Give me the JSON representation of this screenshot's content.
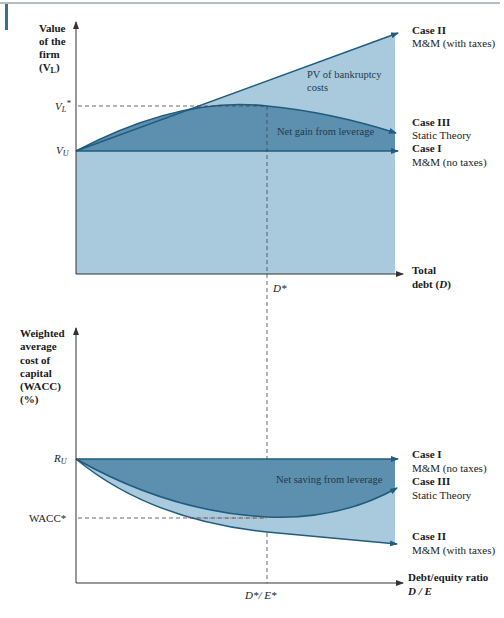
{
  "colors": {
    "light_fill": "#a9c9dc",
    "mid_fill": "#7fa9c3",
    "dark_fill": "#5d8fae",
    "line": "#1f5c80",
    "axis": "#333333",
    "top_rule": "#9aa7ae",
    "accent_bar": "#3d6f8c",
    "dash": "#444444",
    "wacc_dash_red": "#c0504d"
  },
  "top_chart": {
    "y_axis_label": [
      "Value",
      "of the",
      "firm"
    ],
    "y_axis_label_var": "(V",
    "y_axis_label_sub": "L",
    "y_axis_label_close": ")",
    "ticks": {
      "vl_star": {
        "main": "V",
        "sub": "L",
        "sup": "*"
      },
      "vu": {
        "main": "V",
        "sub": "U"
      },
      "d_star": "D*"
    },
    "x_axis_label": [
      "Total",
      "debt (",
      "D",
      ")"
    ],
    "regions": {
      "bankruptcy": [
        "PV of bankruptcy",
        "costs"
      ],
      "net_gain": "Net gain from leverage"
    },
    "cases": [
      {
        "title": "Case II",
        "subtitle": "M&M (with taxes)"
      },
      {
        "title": "Case III",
        "subtitle": "Static Theory"
      },
      {
        "title": "Case I",
        "subtitle": "M&M (no taxes)"
      }
    ]
  },
  "bottom_chart": {
    "y_axis_label": [
      "Weighted",
      "average",
      "cost of",
      "capital",
      "(WACC)",
      "(%)"
    ],
    "ticks": {
      "ru": {
        "main": "R",
        "sub": "U"
      },
      "wacc_star": "WACC*",
      "de_star": "D*/ E*"
    },
    "x_axis_label": [
      "Debt/equity ratio",
      "D / E"
    ],
    "regions": {
      "net_saving": "Net saving from leverage"
    },
    "cases": [
      {
        "title": "Case I",
        "subtitle": "M&M (no taxes)"
      },
      {
        "title": "Case III",
        "subtitle": "Static Theory"
      },
      {
        "title": "Case II",
        "subtitle": "M&M (with taxes)"
      }
    ]
  }
}
